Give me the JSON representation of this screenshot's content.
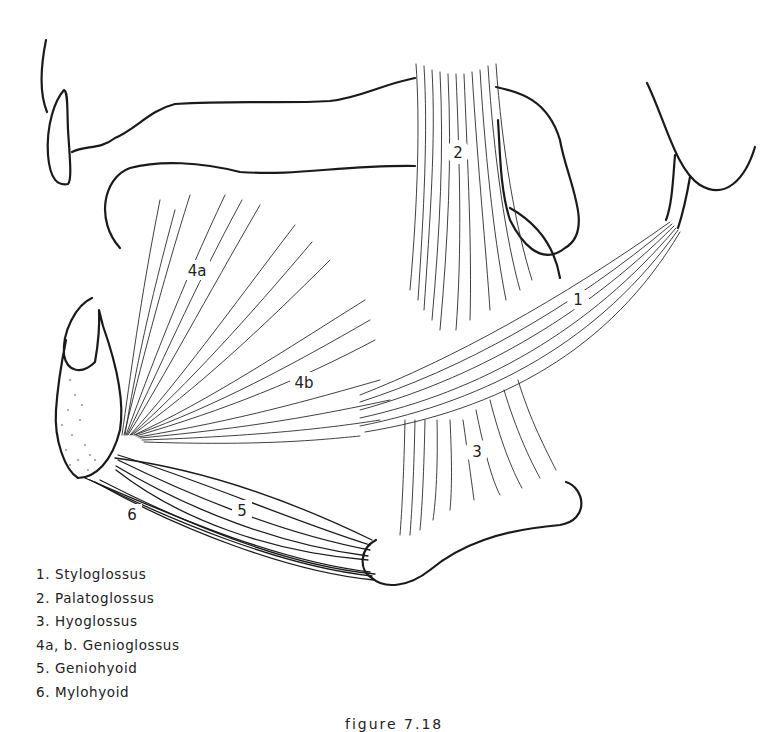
{
  "figure": {
    "caption": "figure 7.18",
    "labels": {
      "m1": "1",
      "m2": "2",
      "m3": "3",
      "m4a": "4a",
      "m4b": "4b",
      "m5": "5",
      "m6": "6"
    },
    "legend": [
      {
        "key": "1.",
        "name": "Styloglossus"
      },
      {
        "key": "2.",
        "name": "Palatoglossus"
      },
      {
        "key": "3.",
        "name": "Hyoglossus"
      },
      {
        "key": "4a, b.",
        "name": "Genioglossus"
      },
      {
        "key": "5.",
        "name": "Geniohyoid"
      },
      {
        "key": "6.",
        "name": "Mylohyoid"
      }
    ]
  },
  "colors": {
    "ink": "#1a1a1a",
    "paper": "#ffffff"
  }
}
